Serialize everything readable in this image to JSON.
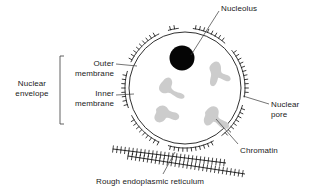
{
  "figure": {
    "background_color": "#ffffff",
    "line_color": "#1a1a1a",
    "chromatin_color": "#cccccc",
    "nucleolus_color": "#000000"
  },
  "labels": {
    "nucleolus": "Nucleolus",
    "nuclear_envelope_line1": "Nuclear",
    "nuclear_envelope_line2": "envelope",
    "outer_membrane_line1": "Outer",
    "outer_membrane_line2": "membrane",
    "inner_membrane_line1": "Inner",
    "inner_membrane_line2": "membrane",
    "nuclear_pore_line1": "Nuclear",
    "nuclear_pore_line2": "pore",
    "chromatin": "Chromatin",
    "rough_er": "Rough endoplasmic reticulum"
  },
  "structures": {
    "nucleolus": {
      "cx": 182,
      "cy": 58,
      "r": 12
    },
    "nucleus": {
      "cx": 185,
      "cy": 88,
      "r": 60
    },
    "chromatin_blobs": 4,
    "rough_er_strands": 2
  }
}
